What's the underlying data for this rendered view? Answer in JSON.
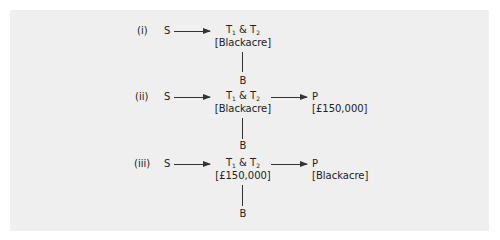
{
  "diagram": {
    "rows": [
      {
        "label": "(i)",
        "source": "S",
        "middle_top": {
          "t1": "T",
          "t1_sub": "1",
          "amp": " & ",
          "t2": "T",
          "t2_sub": "2"
        },
        "middle_bottom": "[Blackacre]",
        "below": "B",
        "right": null
      },
      {
        "label": "(ii)",
        "source": "S",
        "middle_top": {
          "t1": "T",
          "t1_sub": "1",
          "amp": " & ",
          "t2": "T",
          "t2_sub": "2"
        },
        "middle_bottom": "[Blackacre]",
        "below": "B",
        "right": {
          "top": "P",
          "bottom": "[£150,000]"
        }
      },
      {
        "label": "(iii)",
        "source": "S",
        "middle_top": {
          "t1": "T",
          "t1_sub": "1",
          "amp": " & ",
          "t2": "T",
          "t2_sub": "2"
        },
        "middle_bottom": "[£150,000]",
        "below": "B",
        "right": {
          "top": "P",
          "bottom": "[Blackacre]"
        }
      }
    ]
  },
  "colors": {
    "panel_bg": "#efefef",
    "ink": "#222222"
  }
}
